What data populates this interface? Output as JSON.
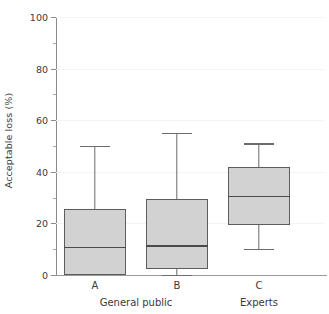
{
  "chart_data": {
    "type": "box",
    "title": "",
    "xlabel": "",
    "ylabel": "Acceptable loss (%)",
    "ylim": [
      0,
      100
    ],
    "grid": true,
    "legend_position": "none",
    "categories": [
      "A",
      "B",
      "C"
    ],
    "group_labels": [
      {
        "label": "General public",
        "categories": [
          "A",
          "B"
        ]
      },
      {
        "label": "Experts",
        "categories": [
          "C"
        ]
      }
    ],
    "y_tick_labels": [
      "0",
      "20",
      "40",
      "60",
      "80",
      "100"
    ],
    "y_ticks_major": [
      0,
      20,
      40,
      60,
      80,
      100
    ],
    "y_ticks_minor": [
      10,
      30,
      50,
      70,
      90
    ],
    "box_fill_color": "#d2d2d2",
    "box_edge_color": "#5d5d5d",
    "median_color": "#4a4a4a",
    "whisker_color": "#6b6b6b",
    "gridline_color": "#f4f4f4",
    "axis_color": "#8a8a8a",
    "boxes": [
      {
        "name": "A",
        "whisker_low": 0,
        "q1": 0,
        "median": 11,
        "q3": 25.5,
        "whisker_high": 50,
        "has_lower_whisker": false
      },
      {
        "name": "B",
        "whisker_low": 0,
        "q1": 2.3,
        "median": 11.5,
        "q3": 29.5,
        "whisker_high": 55,
        "has_lower_whisker": true
      },
      {
        "name": "C",
        "whisker_low": 10.1,
        "q1": 19.4,
        "median": 30.7,
        "q3": 41.8,
        "whisker_high": 51,
        "has_lower_whisker": true
      }
    ]
  }
}
